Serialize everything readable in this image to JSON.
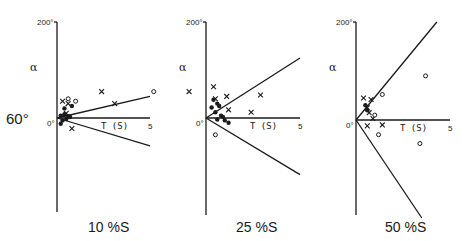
{
  "figure": {
    "side_label": "60°",
    "colors": {
      "ink": "#1a1a1a",
      "background": "#ffffff"
    }
  },
  "chart_data": [
    {
      "type": "scatter",
      "title": "10 %S",
      "xlabel": "T (S)",
      "ylabel": "α",
      "xlim": [
        0,
        5
      ],
      "ylim": [
        -200,
        200
      ],
      "x_ticks": [
        "0°",
        "5"
      ],
      "y_ticks": [
        "200°",
        "0°"
      ],
      "grid": false,
      "fit_lines": [
        {
          "name": "upper bound",
          "from": [
            0,
            0
          ],
          "to": [
            5,
            45
          ]
        },
        {
          "name": "lower bound",
          "from": [
            0,
            0
          ],
          "to": [
            5,
            -58
          ]
        }
      ],
      "series": [
        {
          "name": "crosses",
          "marker": "x",
          "points": [
            [
              2.4,
              55
            ],
            [
              3.1,
              30
            ],
            [
              0.8,
              -22
            ],
            [
              0.3,
              35
            ],
            [
              0.6,
              30
            ],
            [
              0.5,
              10
            ]
          ]
        },
        {
          "name": "circles",
          "marker": "o",
          "points": [
            [
              5.2,
              55
            ],
            [
              1.0,
              35
            ],
            [
              0.6,
              40
            ]
          ]
        },
        {
          "name": "dense cluster",
          "marker": "•",
          "points": [
            [
              0.2,
              5
            ],
            [
              0.4,
              8
            ],
            [
              0.6,
              4
            ],
            [
              0.3,
              -5
            ],
            [
              0.5,
              -2
            ],
            [
              0.7,
              2
            ],
            [
              0.2,
              -12
            ],
            [
              0.4,
              20
            ],
            [
              0.8,
              25
            ]
          ]
        }
      ]
    },
    {
      "type": "scatter",
      "title": "25 %S",
      "xlabel": "T (S)",
      "ylabel": "α",
      "xlim": [
        0,
        5
      ],
      "ylim": [
        -200,
        200
      ],
      "x_ticks": [
        "0°",
        "5"
      ],
      "y_ticks": [
        "200°",
        "0°"
      ],
      "grid": false,
      "fit_lines": [
        {
          "name": "upper bound",
          "from": [
            0,
            0
          ],
          "to": [
            5,
            125
          ]
        },
        {
          "name": "lower bound",
          "from": [
            0,
            0
          ],
          "to": [
            5,
            -118
          ]
        }
      ],
      "series": [
        {
          "name": "crosses",
          "marker": "x",
          "points": [
            [
              -0.9,
              55
            ],
            [
              0.4,
              65
            ],
            [
              1.1,
              45
            ],
            [
              2.9,
              48
            ],
            [
              2.4,
              12
            ],
            [
              1.2,
              17
            ],
            [
              0.5,
              40
            ]
          ]
        },
        {
          "name": "circles",
          "marker": "o",
          "points": [
            [
              0.5,
              -35
            ]
          ]
        },
        {
          "name": "dense cluster",
          "marker": "•",
          "points": [
            [
              0.4,
              38
            ],
            [
              0.6,
              30
            ],
            [
              0.3,
              22
            ],
            [
              0.7,
              25
            ],
            [
              0.5,
              12
            ],
            [
              0.8,
              5
            ],
            [
              1.0,
              -5
            ],
            [
              1.2,
              -10
            ],
            [
              0.9,
              2
            ],
            [
              0.6,
              -3
            ]
          ]
        }
      ]
    },
    {
      "type": "scatter",
      "title": "50 %S",
      "xlabel": "T (S)",
      "ylabel": "α",
      "xlim": [
        0,
        5
      ],
      "ylim": [
        -200,
        200
      ],
      "x_ticks": [
        "0°",
        "5"
      ],
      "y_ticks": [
        "200°",
        "0°"
      ],
      "grid": false,
      "fit_lines": [
        {
          "name": "upper bound",
          "from": [
            0,
            0
          ],
          "to": [
            4.3,
            200
          ]
        },
        {
          "name": "lower bound",
          "from": [
            0,
            0
          ],
          "to": [
            3.5,
            -200
          ]
        }
      ],
      "series": [
        {
          "name": "crosses",
          "marker": "x",
          "points": [
            [
              0.4,
              45
            ],
            [
              0.8,
              42
            ],
            [
              0.6,
              25
            ],
            [
              0.7,
              15
            ],
            [
              0.9,
              3
            ],
            [
              0.6,
              -12
            ],
            [
              1.4,
              -10
            ]
          ]
        },
        {
          "name": "circles",
          "marker": "o",
          "points": [
            [
              1.4,
              52
            ],
            [
              3.7,
              90
            ],
            [
              1.0,
              10
            ],
            [
              1.2,
              -30
            ],
            [
              3.4,
              -48
            ]
          ]
        },
        {
          "name": "dense cluster",
          "marker": "•",
          "points": [
            [
              0.5,
              30
            ],
            [
              0.6,
              20
            ]
          ]
        }
      ]
    }
  ]
}
